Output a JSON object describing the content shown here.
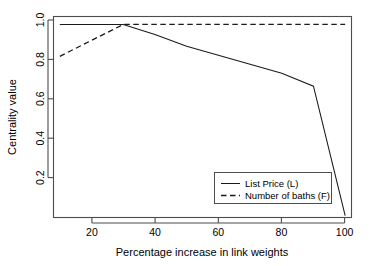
{
  "chart_data": {
    "type": "line",
    "title": "",
    "xlabel": "Percentage increase in link weights",
    "ylabel": "Centrality value",
    "xlim": [
      8,
      102
    ],
    "ylim": [
      0.03,
      1.04
    ],
    "xticks": [
      20,
      40,
      60,
      80,
      100
    ],
    "yticks": [
      0.2,
      0.4,
      0.6,
      0.8,
      1.0
    ],
    "xtick_labels": [
      "20",
      "40",
      "60",
      "80",
      "100"
    ],
    "ytick_labels": [
      "0.2",
      "0.4",
      "0.6",
      "0.8",
      "1.0"
    ],
    "grid": false,
    "legend_position": "bottom-right",
    "series": [
      {
        "name": "List Price (L)",
        "style": "solid",
        "color": "#1a1a1a",
        "x": [
          10,
          20,
          30,
          40,
          50,
          60,
          70,
          80,
          90,
          100
        ],
        "values": [
          1.0,
          1.0,
          1.0,
          0.95,
          0.89,
          0.845,
          0.8,
          0.755,
          0.69,
          0.04
        ]
      },
      {
        "name": "Number of baths (F)",
        "style": "dashed",
        "color": "#1a1a1a",
        "x": [
          10,
          20,
          30,
          40,
          50,
          60,
          70,
          80,
          90,
          100
        ],
        "values": [
          0.84,
          0.92,
          1.0,
          1.0,
          1.0,
          1.0,
          1.0,
          1.0,
          1.0,
          1.0
        ]
      }
    ]
  },
  "axes": {
    "x_title": "Percentage increase in link weights",
    "y_title": "Centrality value",
    "x_tick_0": "20",
    "x_tick_1": "40",
    "x_tick_2": "60",
    "x_tick_3": "80",
    "x_tick_4": "100",
    "y_tick_0": "0.2",
    "y_tick_1": "0.4",
    "y_tick_2": "0.6",
    "y_tick_3": "0.8",
    "y_tick_4": "1.0"
  },
  "legend": {
    "entry_0": "List Price (L)",
    "entry_1": "Number of baths (F)"
  }
}
